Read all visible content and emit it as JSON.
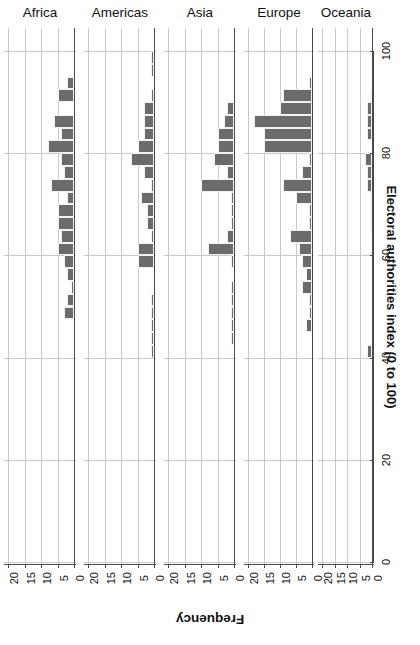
{
  "chart_data": {
    "type": "bar",
    "title": "",
    "subtitle": "",
    "orientation": "horizontal-rotated-180",
    "xlabel": "Frequency",
    "ylabel": "Electoral authorities index (0 to 100)",
    "xlim": [
      0,
      20
    ],
    "xticks": [
      20,
      15,
      10,
      5,
      0
    ],
    "ylim": [
      0,
      105
    ],
    "yticks": [
      0,
      20,
      40,
      60,
      80,
      100
    ],
    "grid": true,
    "legend": "none",
    "bin_width": 2.5,
    "bar_color": "#6b6b6b",
    "panels": [
      "Africa",
      "Americas",
      "Asia",
      "Europe",
      "Oceania"
    ],
    "series": [
      {
        "name": "Africa",
        "bins": [
          {
            "center": 93.75,
            "value": 2
          },
          {
            "center": 91.25,
            "value": 5
          },
          {
            "center": 88.75,
            "value": 0
          },
          {
            "center": 86.25,
            "value": 6
          },
          {
            "center": 83.75,
            "value": 4
          },
          {
            "center": 81.25,
            "value": 8
          },
          {
            "center": 78.75,
            "value": 4
          },
          {
            "center": 76.25,
            "value": 3
          },
          {
            "center": 73.75,
            "value": 7
          },
          {
            "center": 71.25,
            "value": 2
          },
          {
            "center": 68.75,
            "value": 5
          },
          {
            "center": 66.25,
            "value": 5
          },
          {
            "center": 63.75,
            "value": 4
          },
          {
            "center": 61.25,
            "value": 5
          },
          {
            "center": 58.75,
            "value": 3
          },
          {
            "center": 56.25,
            "value": 2
          },
          {
            "center": 53.75,
            "value": 1
          },
          {
            "center": 51.25,
            "value": 2
          },
          {
            "center": 48.75,
            "value": 3
          },
          {
            "center": 46.25,
            "value": 0
          },
          {
            "center": 43.75,
            "value": 0
          },
          {
            "center": 41.25,
            "value": 0
          },
          {
            "center": 38.75,
            "value": 0
          },
          {
            "center": 36.25,
            "value": 0
          },
          {
            "center": 33.75,
            "value": 0
          },
          {
            "center": 31.25,
            "value": 0
          },
          {
            "center": 28.75,
            "value": 0
          },
          {
            "center": 26.25,
            "value": 0
          }
        ]
      },
      {
        "name": "Americas",
        "bins": [
          {
            "center": 98.75,
            "value": 1
          },
          {
            "center": 96.25,
            "value": 1
          },
          {
            "center": 93.75,
            "value": 0
          },
          {
            "center": 91.25,
            "value": 1
          },
          {
            "center": 88.75,
            "value": 3
          },
          {
            "center": 86.25,
            "value": 3
          },
          {
            "center": 83.75,
            "value": 3
          },
          {
            "center": 81.25,
            "value": 5
          },
          {
            "center": 78.75,
            "value": 7
          },
          {
            "center": 76.25,
            "value": 3
          },
          {
            "center": 73.75,
            "value": 1
          },
          {
            "center": 71.25,
            "value": 4
          },
          {
            "center": 68.75,
            "value": 2
          },
          {
            "center": 66.25,
            "value": 2
          },
          {
            "center": 63.75,
            "value": 1
          },
          {
            "center": 61.25,
            "value": 5
          },
          {
            "center": 58.75,
            "value": 5
          },
          {
            "center": 56.25,
            "value": 0
          },
          {
            "center": 53.75,
            "value": 0
          },
          {
            "center": 51.25,
            "value": 1
          },
          {
            "center": 48.75,
            "value": 1
          },
          {
            "center": 46.25,
            "value": 1
          },
          {
            "center": 43.75,
            "value": 1
          },
          {
            "center": 41.25,
            "value": 1
          }
        ]
      },
      {
        "name": "Asia",
        "bins": [
          {
            "center": 88.75,
            "value": 2
          },
          {
            "center": 86.25,
            "value": 3
          },
          {
            "center": 83.75,
            "value": 5
          },
          {
            "center": 81.25,
            "value": 5
          },
          {
            "center": 78.75,
            "value": 6
          },
          {
            "center": 76.25,
            "value": 2
          },
          {
            "center": 73.75,
            "value": 10
          },
          {
            "center": 71.25,
            "value": 1
          },
          {
            "center": 68.75,
            "value": 1
          },
          {
            "center": 66.25,
            "value": 1
          },
          {
            "center": 63.75,
            "value": 2
          },
          {
            "center": 61.25,
            "value": 8
          },
          {
            "center": 58.75,
            "value": 1
          },
          {
            "center": 56.25,
            "value": 0
          },
          {
            "center": 53.75,
            "value": 1
          },
          {
            "center": 51.25,
            "value": 1
          },
          {
            "center": 48.75,
            "value": 1
          },
          {
            "center": 46.25,
            "value": 1
          },
          {
            "center": 43.75,
            "value": 1
          }
        ]
      },
      {
        "name": "Europe",
        "bins": [
          {
            "center": 93.75,
            "value": 1
          },
          {
            "center": 91.25,
            "value": 9
          },
          {
            "center": 88.75,
            "value": 10
          },
          {
            "center": 86.25,
            "value": 18
          },
          {
            "center": 83.75,
            "value": 15
          },
          {
            "center": 81.25,
            "value": 15
          },
          {
            "center": 78.75,
            "value": 1
          },
          {
            "center": 76.25,
            "value": 3
          },
          {
            "center": 73.75,
            "value": 9
          },
          {
            "center": 71.25,
            "value": 5
          },
          {
            "center": 68.75,
            "value": 1
          },
          {
            "center": 66.25,
            "value": 1
          },
          {
            "center": 63.75,
            "value": 7
          },
          {
            "center": 61.25,
            "value": 4
          },
          {
            "center": 58.75,
            "value": 3
          },
          {
            "center": 56.25,
            "value": 2
          },
          {
            "center": 53.75,
            "value": 3
          },
          {
            "center": 51.25,
            "value": 1
          },
          {
            "center": 48.75,
            "value": 1
          },
          {
            "center": 46.25,
            "value": 2
          },
          {
            "center": 43.75,
            "value": 0
          },
          {
            "center": 41.25,
            "value": 0
          }
        ]
      },
      {
        "name": "Oceania",
        "bins": [
          {
            "center": 91.25,
            "value": 1
          },
          {
            "center": 88.75,
            "value": 2
          },
          {
            "center": 86.25,
            "value": 2
          },
          {
            "center": 83.75,
            "value": 2
          },
          {
            "center": 81.25,
            "value": 0
          },
          {
            "center": 78.75,
            "value": 3
          },
          {
            "center": 76.25,
            "value": 2
          },
          {
            "center": 73.75,
            "value": 2
          },
          {
            "center": 71.25,
            "value": 1
          },
          {
            "center": 68.75,
            "value": 1
          },
          {
            "center": 66.25,
            "value": 1
          },
          {
            "center": 41.25,
            "value": 2
          }
        ]
      }
    ]
  }
}
